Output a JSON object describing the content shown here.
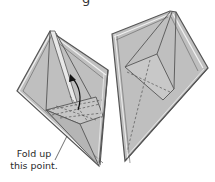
{
  "diagram": {
    "type": "origami-instruction",
    "top_fragment_text": "g",
    "caption": {
      "line1": "Fold up",
      "line2": "this point."
    },
    "colors": {
      "paper_fill": "#bdbdbd",
      "paper_light": "#cfcfcf",
      "edge": "#5a5a5a",
      "edge_highlight": "#f2f2f2",
      "dashed": "#555555",
      "arrow": "#111111"
    },
    "figures": [
      {
        "name": "left-model",
        "state": "before-fold",
        "has_arrow": true,
        "arrow_direction": "up"
      },
      {
        "name": "right-model",
        "state": "after-fold",
        "has_arrow": false
      }
    ]
  }
}
